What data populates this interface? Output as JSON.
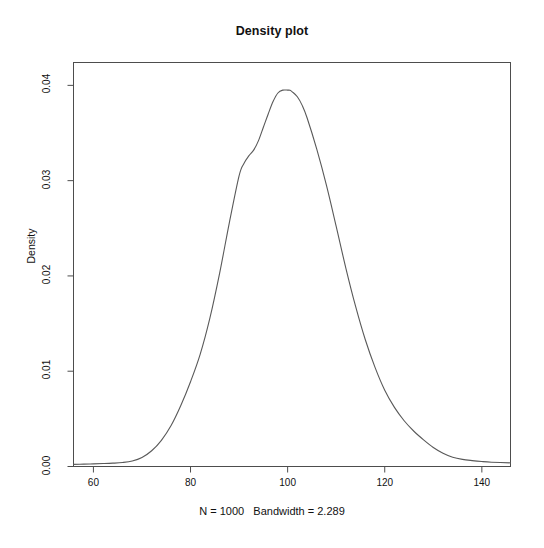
{
  "chart_data": {
    "type": "line",
    "title": "Density plot",
    "subtitle": "N = 1000   Bandwidth = 2.289",
    "xlabel": "",
    "ylabel": "Density",
    "xlim": [
      55.9,
      145.9
    ],
    "ylim": [
      0.0,
      0.0424
    ],
    "grid": false,
    "legend": null,
    "xticks": [
      60,
      80,
      100,
      120,
      140
    ],
    "xticklabels": [
      "60",
      "80",
      "100",
      "120",
      "140"
    ],
    "yticks": [
      0.0,
      0.01,
      0.02,
      0.03,
      0.04
    ],
    "yticklabels": [
      "0.00",
      "0.01",
      "0.02",
      "0.03",
      "0.04"
    ],
    "series": [
      {
        "name": "Density",
        "x": [
          55.9,
          58.0,
          60.0,
          62.0,
          64.0,
          66.0,
          68.0,
          70.0,
          72.0,
          74.0,
          76.0,
          78.0,
          80.0,
          82.0,
          84.0,
          86.0,
          88.0,
          90.0,
          91.0,
          92.0,
          93.0,
          94.0,
          95.0,
          96.0,
          97.0,
          98.0,
          99.0,
          100.0,
          100.5,
          101.0,
          102.0,
          103.0,
          104.0,
          106.0,
          108.0,
          110.0,
          112.0,
          114.0,
          116.0,
          118.0,
          120.0,
          122.0,
          124.0,
          126.0,
          128.0,
          130.0,
          132.0,
          134.0,
          136.0,
          138.0,
          140.0,
          142.0,
          145.9
        ],
        "y": [
          0.00022,
          0.00025,
          0.00028,
          0.00031,
          0.00035,
          0.00042,
          0.00058,
          0.00095,
          0.00165,
          0.00275,
          0.0043,
          0.0064,
          0.0089,
          0.0118,
          0.0156,
          0.0203,
          0.0256,
          0.0305,
          0.0318,
          0.0326,
          0.0332,
          0.0342,
          0.0356,
          0.037,
          0.0383,
          0.0392,
          0.0395,
          0.0395,
          0.03948,
          0.0393,
          0.0388,
          0.0379,
          0.0366,
          0.0333,
          0.0295,
          0.0252,
          0.0208,
          0.0168,
          0.0133,
          0.0104,
          0.008,
          0.0062,
          0.0048,
          0.0037,
          0.0028,
          0.002,
          0.0014,
          0.00098,
          0.00075,
          0.00062,
          0.00052,
          0.00045,
          0.00038
        ]
      }
    ]
  },
  "plot": {
    "title": "Density plot",
    "subtitle": "N = 1000   Bandwidth = 2.289",
    "y_axis_title": "Density",
    "x_tick_labels": [
      "60",
      "80",
      "100",
      "120",
      "140"
    ],
    "y_tick_labels": [
      "0.00",
      "0.01",
      "0.02",
      "0.03",
      "0.04"
    ],
    "colors": {
      "curve": "#595959",
      "axis": "#4d4d4d",
      "text": "#111111",
      "background": "#ffffff"
    }
  }
}
